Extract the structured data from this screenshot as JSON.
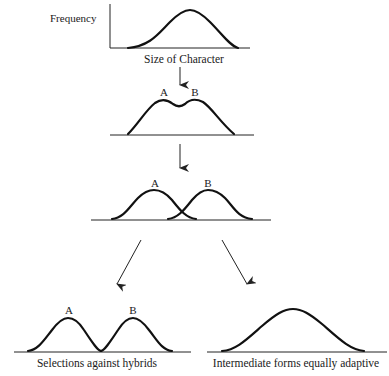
{
  "panel1": {
    "ylabel": "Frequency",
    "xlabel": "Size of Character"
  },
  "panel2": {
    "peak_a": "A",
    "peak_b": "B"
  },
  "panel3": {
    "peak_a": "A",
    "peak_b": "B"
  },
  "panel4": {
    "peak_a": "A",
    "peak_b": "B",
    "caption": "Selections against hybrids"
  },
  "panel5": {
    "caption": "Intermediate forms equally adaptive"
  }
}
